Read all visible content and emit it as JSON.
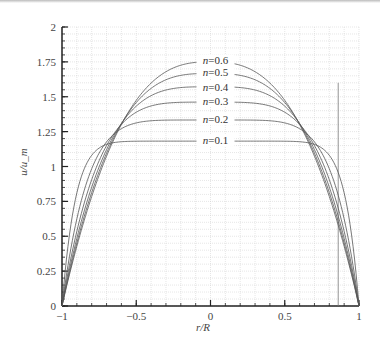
{
  "chart_data": {
    "type": "line",
    "title": "",
    "xlabel": "r/R",
    "ylabel": "u/u_m",
    "xlim": [
      -1,
      1
    ],
    "ylim": [
      0,
      2
    ],
    "x_ticks": [
      "-1",
      "-0.5",
      "0",
      "0.5",
      "1"
    ],
    "x_tick_values": [
      -1,
      -0.5,
      0,
      0.5,
      1
    ],
    "y_ticks": [
      "0",
      "0.25",
      "0.5",
      "0.75",
      "1",
      "1.25",
      "1.5",
      "1.75",
      "2"
    ],
    "y_tick_values": [
      0,
      0.25,
      0.5,
      0.75,
      1,
      1.25,
      1.5,
      1.75,
      2
    ],
    "grid": true,
    "legend": "inline labels",
    "series": [
      {
        "name": "n=0.1",
        "n": 0.1,
        "peak": 1.18,
        "label_y": 1.19
      },
      {
        "name": "n=0.2",
        "n": 0.2,
        "peak": 1.33,
        "label_y": 1.34
      },
      {
        "name": "n=0.3",
        "n": 0.3,
        "peak": 1.46,
        "label_y": 1.47
      },
      {
        "name": "n=0.4",
        "n": 0.4,
        "peak": 1.57,
        "label_y": 1.57
      },
      {
        "name": "n=0.5",
        "n": 0.5,
        "peak": 1.67,
        "label_y": 1.68
      },
      {
        "name": "n=0.6",
        "n": 0.6,
        "peak": 1.75,
        "label_y": 1.76
      }
    ],
    "profile_formula": "u/u_m = (3n+1)/(n+1) * (1 - |r/R|^((n+1)/n))",
    "annotations": [
      {
        "type": "vertical_line",
        "x": 0.86,
        "y_from": 0,
        "y_to": 1.6
      }
    ],
    "colors": {
      "curves": "#555555",
      "grid": "#cccccc",
      "axis": "#222222",
      "text": "#444444"
    }
  }
}
